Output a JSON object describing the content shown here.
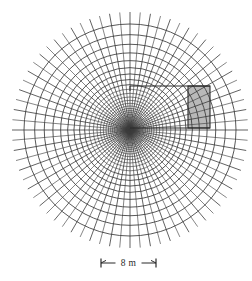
{
  "figure": {
    "title": "",
    "caption": "",
    "background_color": "#ffffff",
    "line_color": "#3a3a3a",
    "inset_fill_color": "#b9b9b9",
    "inset_stroke_color": "#2b2b2b"
  },
  "mesh": {
    "kind": "radial-polar-mesh",
    "description": "Axisymmetric radial finite-element mesh of concentric circles and radial spokes",
    "center": {
      "x": 130,
      "y": 130
    },
    "num_radial_spokes": 72,
    "num_concentric_rings": 34,
    "outer_ring_radius": 106,
    "spoke_outer_radius": 118,
    "inner_core_radius": 3.2,
    "ring_growth": "geometric",
    "ring_growth_factor": 1.155
  },
  "inset_box": {
    "label": "",
    "x": 188,
    "y": 86,
    "width": 22,
    "height": 42,
    "connector_left_x": 130,
    "connector_top_y": 86,
    "connector_bottom_y": 128
  },
  "scale_bar": {
    "label": "8 m",
    "value": 8,
    "unit": "m",
    "x_start": 101,
    "x_end": 156,
    "y": 263,
    "tick_height": 9
  }
}
